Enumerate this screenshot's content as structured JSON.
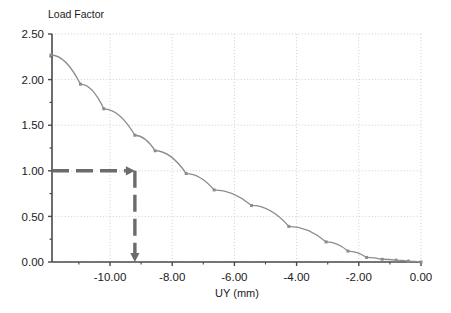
{
  "chart_data": {
    "type": "line",
    "title": "Load Factor",
    "xlabel": "UY (mm)",
    "ylabel": "Load Factor",
    "xlim": [
      -12.1,
      0.0
    ],
    "ylim": [
      0.0,
      2.5
    ],
    "grid": true,
    "legend": "none",
    "x_ticks": [
      -10.0,
      -8.0,
      -6.0,
      -4.0,
      -2.0,
      0.0
    ],
    "x_tick_labels": [
      "-10.00",
      "-8.00",
      "-6.00",
      "-4.00",
      "-2.00",
      "0.00"
    ],
    "y_ticks": [
      0.0,
      0.5,
      1.0,
      1.5,
      2.0,
      2.5
    ],
    "y_tick_labels": [
      "0.00",
      "0.50",
      "1.00",
      "1.50",
      "2.00",
      "2.50"
    ],
    "y_minor_ticks": [
      0.25,
      0.75,
      1.25,
      1.75,
      2.25
    ],
    "series": [
      {
        "name": "Load-displacement curve",
        "color": "#8c8c8c",
        "marker": "square",
        "x": [
          -11.9,
          -10.95,
          -10.2,
          -9.2,
          -8.55,
          -7.55,
          -6.65,
          -5.45,
          -4.25,
          -3.05,
          -2.35,
          -1.75,
          -1.25,
          -0.8,
          -0.4,
          0.0
        ],
        "y": [
          2.27,
          1.95,
          1.68,
          1.39,
          1.22,
          0.97,
          0.79,
          0.62,
          0.39,
          0.22,
          0.12,
          0.05,
          0.03,
          0.02,
          0.01,
          0.0
        ]
      }
    ],
    "annotations": [
      {
        "name": "load-factor-reference-arrow",
        "style": "dashed-arrow",
        "color": "#6b6b6b",
        "horizontal": {
          "from_x": -12.1,
          "to_x": -9.2,
          "at_y": 1.0
        },
        "vertical": {
          "at_x": -9.2,
          "from_y": 1.0,
          "to_y": 0.0
        },
        "described_value": {
          "load_factor": 1.0,
          "uy_mm": -9.2
        }
      }
    ]
  },
  "chart": {
    "title": "Load Factor",
    "xlabel": "UY (mm)"
  }
}
